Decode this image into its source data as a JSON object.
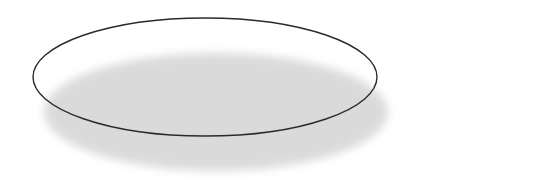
{
  "chart_data": {
    "type": "pie",
    "title": "",
    "subtitle": "",
    "xlabel": "",
    "ylabel": "",
    "legend_position": "right",
    "grid": false,
    "three_d": true,
    "categories": [
      "11 years",
      "12 years",
      "13 years",
      "14 years",
      "15 years"
    ],
    "values": [
      3.13,
      4.42,
      4.58,
      6.49,
      7.44
    ],
    "total": 26.06,
    "labels": [
      "3.13",
      "4.42",
      "4.58",
      "6.49",
      "7.44"
    ],
    "colors": [
      "#dcdcdc",
      "#9d9d9d",
      "#fbfbfb",
      "#c9c9c9",
      "#e7e7e7"
    ],
    "slices": [
      {
        "label": "3.13",
        "value": 3.13,
        "category": "11 years",
        "color": "#dcdcdc",
        "start_angle": 0,
        "end_angle": 43.25,
        "label_x": 222,
        "label_y": 38
      },
      {
        "label": "4.42",
        "value": 4.42,
        "category": "12 years",
        "color": "#9d9d9d",
        "start_angle": 43.25,
        "end_angle": 104.33,
        "label_x": 306,
        "label_y": 64
      },
      {
        "label": "4.58",
        "value": 4.58,
        "category": "13 years",
        "color": "#fbfbfb",
        "start_angle": 104.33,
        "end_angle": 167.63,
        "label_x": 272,
        "label_y": 102
      },
      {
        "label": "6.49",
        "value": 6.49,
        "category": "14 years",
        "color": "#c9c9c9",
        "start_angle": 167.63,
        "end_angle": 257.31,
        "label_x": 155,
        "label_y": 106
      },
      {
        "label": "7.44",
        "value": 7.44,
        "category": "15 years",
        "color": "#e7e7e7",
        "start_angle": 257.31,
        "end_angle": 360,
        "label_x": 125,
        "label_y": 49
      }
    ]
  },
  "legend": {
    "items": [
      {
        "label": "11 years",
        "color": "#dcdcdc"
      },
      {
        "label": "12 years",
        "color": "#9d9d9d"
      },
      {
        "label": "13 years",
        "color": "#fbfbfb"
      },
      {
        "label": "14 years",
        "color": "#c9c9c9"
      },
      {
        "label": "15 years",
        "color": "#e7e7e7"
      }
    ]
  },
  "style": {
    "outline_color": "#2b2b2b",
    "separator_color": "#ffffff",
    "shadow_color": "#bdbdbd",
    "background": "#ffffff"
  }
}
